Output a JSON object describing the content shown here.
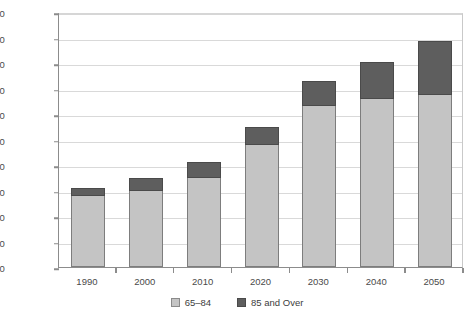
{
  "chart_data": {
    "type": "bar",
    "stacked": true,
    "title": "",
    "subtitle": "",
    "xlabel": "",
    "ylabel": "",
    "categories": [
      "1990",
      "2000",
      "2010",
      "2020",
      "2030",
      "2040",
      "2050"
    ],
    "series": [
      {
        "name": "65–84",
        "color": "#c4c4c4",
        "values": [
          28000,
          30000,
          35000,
          48000,
          63000,
          66000,
          67500
        ]
      },
      {
        "name": "85 and Over",
        "color": "#5e5e5e",
        "values": [
          3000,
          5000,
          6000,
          7000,
          10000,
          14500,
          21000
        ]
      }
    ],
    "totals": [
      31000,
      35000,
      41000,
      55000,
      73000,
      80500,
      88500
    ],
    "ylim": [
      0,
      100000
    ],
    "yticks": [
      0,
      10000,
      20000,
      30000,
      40000,
      50000,
      60000,
      70000,
      80000,
      90000,
      100000
    ],
    "ytick_labels": [
      "0",
      "10,000",
      "20,000",
      "30,000",
      "40,000",
      "50,000",
      "60,000",
      "70,000",
      "80,000",
      "90,000",
      "100,000"
    ],
    "grid": true,
    "grid_axis": "y",
    "legend_position": "bottom",
    "legend_entries": [
      "65–84",
      "85 and Over"
    ]
  },
  "colors": {
    "series_65_84": "#c4c4c4",
    "series_85_over": "#5e5e5e",
    "axis": "#8c8c8c",
    "gridline": "#d9d9d9",
    "text": "#4a4a4a",
    "background": "#ffffff"
  }
}
